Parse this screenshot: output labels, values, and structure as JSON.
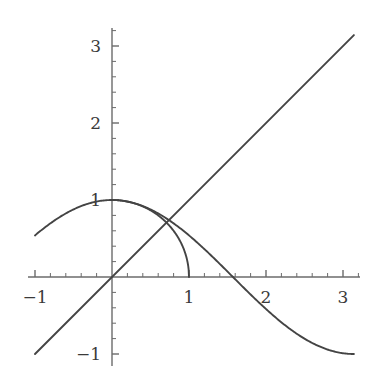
{
  "figure": {
    "kind": "mathematical-function-plot",
    "background": "#ffffff",
    "curve_color": "#444444",
    "axis_color": "#6b6b6b",
    "label_color": "#3a3a3a",
    "width": 377,
    "height": 382
  },
  "axes": {
    "origin_px": {
      "x": 112,
      "y": 277
    },
    "pixels_per_unit": 77,
    "x_axis_label": "",
    "y_axis_label": "",
    "x_tick_labels": [
      "-1",
      "1",
      "2",
      "3"
    ],
    "x_tick_values": [
      -1,
      1,
      2,
      3
    ],
    "y_tick_labels": [
      "-1",
      "1",
      "2",
      "3"
    ],
    "y_tick_values": [
      -1,
      1,
      2,
      3
    ],
    "minor_tick_step": 0.2,
    "major_tick_len": 7,
    "minor_tick_len": 4,
    "x_range_px": [
      28,
      360
    ],
    "y_range_px": [
      28,
      366
    ]
  },
  "chart_data": {
    "type": "line",
    "title": "",
    "subtitle": "",
    "xlabel": "",
    "ylabel": "",
    "xlim": [
      -1.1,
      3.22
    ],
    "ylim": [
      -1.15,
      3.23
    ],
    "grid": false,
    "legend": null,
    "xticks": [
      -1,
      1,
      2,
      3
    ],
    "yticks": [
      -1,
      1,
      2,
      3
    ],
    "minor_tick_step": 0.2,
    "series": [
      {
        "name": "cos(x)",
        "expression": "y = cos(x)",
        "color": "#444444",
        "domain": [
          -1.0,
          3.1416
        ],
        "samples": 260,
        "notes": "starts near (-1, 3.14) descending steeply, crosses y-axis at 1.5708, crosses x-axis at 1.5708, flattens to -1 at x = pi"
      },
      {
        "name": "y = x",
        "expression": "y = x",
        "color": "#444444",
        "domain": [
          -1.0,
          3.1416
        ],
        "samples": 2,
        "notes": "straight diagonal from (-1,-1) to (pi, pi)"
      },
      {
        "name": "sqrt(1-x^2)",
        "expression": "y = sqrt(1 - x^2)",
        "color": "#444444",
        "domain": [
          0.0,
          1.0
        ],
        "samples": 200,
        "notes": "quarter unit circle from (0,1) to (1,0)"
      }
    ],
    "intersections": [
      {
        "label": "",
        "x": 0.739,
        "y": 0.739
      }
    ]
  }
}
